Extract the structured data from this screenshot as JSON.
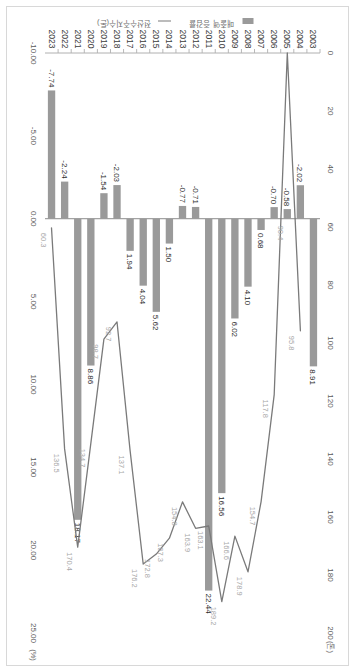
{
  "chart_data": {
    "type": "bar",
    "title": "",
    "subtitle": "",
    "orientation": "horizontal-rotated",
    "categories": [
      "2003",
      "2004",
      "2005",
      "2006",
      "2007",
      "2008",
      "2009",
      "2010",
      "2011",
      "2012",
      "2013",
      "2014",
      "2015",
      "2016",
      "2017",
      "2018",
      "2019",
      "2020",
      "2021",
      "2022",
      "2023"
    ],
    "xlabel": "",
    "ylabel": "",
    "series": [
      {
        "name": "매출액 증감률",
        "type": "bar",
        "axis": "bottom",
        "unit": "(%)",
        "color": "#9a9a9a",
        "values": [
          8.91,
          -2.02,
          -0.58,
          -0.7,
          0.68,
          4.1,
          6.02,
          16.56,
          22.44,
          -0.71,
          -0.77,
          1.5,
          5.62,
          4.04,
          1.94,
          -2.03,
          -1.54,
          8.86,
          18.17,
          -2.24,
          -7.74
        ],
        "labels": [
          "8.91",
          "-2.02",
          "-0.58",
          "-0.70",
          "0.68",
          "4.10",
          "6.02",
          "16.56",
          "22.44",
          "-0.71",
          "-0.77",
          "1.50",
          "5.62",
          "4.04",
          "1.94",
          "-2.03",
          "-1.54",
          "8.86",
          "18.17",
          "-2.24",
          "-7.74"
        ]
      },
      {
        "name": "전산수주지수(톤)",
        "type": "line",
        "axis": "top",
        "color": "#7a7a7a",
        "values": [
          null,
          95.8,
          0.0,
          117.8,
          154.7,
          178.9,
          166.6,
          189.2,
          163.1,
          163.9,
          154.8,
          167.3,
          172.8,
          176.2,
          137.1,
          92.7,
          98.7,
          134.7,
          170.4,
          136.5,
          60.3
        ],
        "labels": [
          "",
          "95.8",
          "",
          "117.8",
          "154.7",
          "178.9",
          "166.6",
          "189.2",
          "163.1",
          "163.9",
          "154.8",
          "167.3",
          "172.8",
          "176.2",
          "137.1",
          "92.7",
          "98.7",
          "134.7",
          "170.4",
          "136.5",
          "60.3"
        ],
        "extra_labels": [
          {
            "category": "2006",
            "value": "90.4"
          }
        ]
      }
    ],
    "top_axis": {
      "ticks": [
        0,
        20,
        40,
        60,
        80,
        100,
        120,
        140,
        160,
        180,
        200
      ],
      "tick_labels": [
        "0",
        "20",
        "40",
        "60",
        "80",
        "100",
        "120",
        "140",
        "160",
        "180",
        "200"
      ],
      "unit": "(톤)",
      "range": [
        0,
        200
      ]
    },
    "bottom_axis": {
      "ticks": [
        -10,
        -5,
        0,
        5,
        10,
        15,
        20,
        25
      ],
      "tick_labels": [
        "-10.00",
        "-5.00",
        "0.00",
        "5.00",
        "10.00",
        "15.00",
        "20.00",
        "25.00"
      ],
      "unit": "(%)",
      "range": [
        -10,
        25
      ]
    },
    "legend": {
      "position": "left",
      "entries": [
        {
          "label": "매출액 증감률",
          "marker": "bar",
          "color": "#9a9a9a"
        },
        {
          "label": "전산수주지수(톤)",
          "marker": "line",
          "color": "#7a7a7a"
        }
      ]
    },
    "grid": false
  }
}
